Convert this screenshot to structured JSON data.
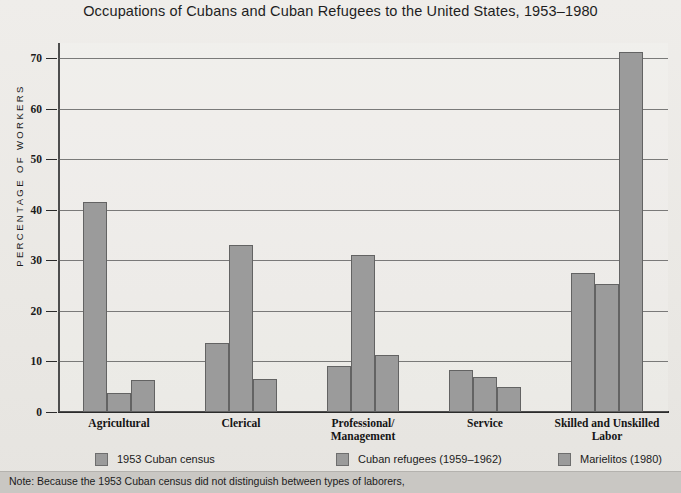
{
  "chart_data": {
    "type": "bar",
    "title": "Occupations of Cubans and Cuban Refugees to the United States, 1953–1980",
    "xlabel": "",
    "ylabel": "PERCENTAGE OF WORKERS",
    "ylim": [
      0,
      73
    ],
    "yticks": [
      0,
      10,
      20,
      30,
      40,
      50,
      60,
      70
    ],
    "ytick_labels": [
      "0",
      "10",
      "20",
      "30",
      "40",
      "50",
      "60",
      "70"
    ],
    "grid": true,
    "legend_position": "bottom",
    "categories": [
      "Agricultural",
      "Clerical",
      "Professional/\nManagement",
      "Service",
      "Skilled and Unskilled\nLabor"
    ],
    "category_lines": [
      [
        "Agricultural"
      ],
      [
        "Clerical"
      ],
      [
        "Professional/",
        "Management"
      ],
      [
        "Service"
      ],
      [
        "Skilled and Unskilled",
        "Labor"
      ]
    ],
    "series": [
      {
        "name": "1953 Cuban census",
        "color": "#9b9b9b",
        "values": [
          41.5,
          13.7,
          9.2,
          8.4,
          27.6
        ]
      },
      {
        "name": "Cuban refugees (1959–1962)",
        "color": "#9b9b9b",
        "values": [
          3.8,
          33.0,
          31.0,
          7.0,
          25.4
        ]
      },
      {
        "name": "Marielitos (1980)",
        "color": "#9b9b9b",
        "values": [
          6.3,
          6.5,
          11.2,
          4.9,
          71.3
        ]
      }
    ],
    "note": "Note: Because the 1953 Cuban census did not distinguish between types of laborers,"
  },
  "legend": {
    "items": [
      {
        "label": "1953 Cuban census"
      },
      {
        "label": "Cuban refugees (1959–1962)"
      },
      {
        "label": "Marielitos (1980)"
      }
    ]
  }
}
